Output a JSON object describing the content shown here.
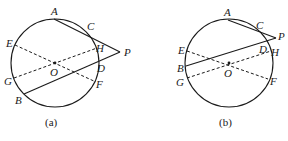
{
  "figures": [
    {
      "id": "a",
      "caption": "(a)",
      "circle": {
        "cx": 55,
        "cy": 63,
        "r": 44
      },
      "points": {
        "A": {
          "label": "A",
          "x": 54,
          "y": 19
        },
        "C": {
          "label": "C",
          "x": 88,
          "y": 32
        },
        "P": {
          "label": "P",
          "x": 120,
          "y": 52
        },
        "H": {
          "label": "H",
          "x": 97,
          "y": 48
        },
        "D": {
          "label": "D",
          "x": 98,
          "y": 71
        },
        "B": {
          "label": "B",
          "x": 24,
          "y": 94
        },
        "E": {
          "label": "E",
          "x": 15,
          "y": 45
        },
        "G": {
          "label": "G",
          "x": 14,
          "y": 78
        },
        "F": {
          "label": "F",
          "x": 96,
          "y": 82
        },
        "O": {
          "label": "O",
          "x": 55,
          "y": 63
        }
      },
      "solid_lines": [
        [
          "A",
          "P"
        ],
        [
          "B",
          "P"
        ]
      ],
      "dashed_lines": [
        [
          "E",
          "F"
        ],
        [
          "G",
          "H"
        ]
      ]
    },
    {
      "id": "b",
      "caption": "(b)",
      "circle": {
        "cx": 229,
        "cy": 63,
        "r": 44
      },
      "points": {
        "A": {
          "label": "A",
          "x": 228,
          "y": 20
        },
        "C": {
          "label": "C",
          "x": 258,
          "y": 30
        },
        "P": {
          "label": "P",
          "x": 276,
          "y": 38
        },
        "D": {
          "label": "D",
          "x": 264,
          "y": 46
        },
        "H": {
          "label": "H",
          "x": 271,
          "y": 51
        },
        "B": {
          "label": "B",
          "x": 186,
          "y": 66
        },
        "E": {
          "label": "E",
          "x": 187,
          "y": 51
        },
        "G": {
          "label": "G",
          "x": 187,
          "y": 78
        },
        "F": {
          "label": "F",
          "x": 268,
          "y": 79
        },
        "O": {
          "label": "O",
          "x": 229,
          "y": 63
        }
      },
      "solid_lines": [
        [
          "A",
          "P"
        ],
        [
          "B",
          "P"
        ]
      ],
      "dashed_lines": [
        [
          "E",
          "F"
        ],
        [
          "G",
          "H"
        ]
      ]
    }
  ]
}
